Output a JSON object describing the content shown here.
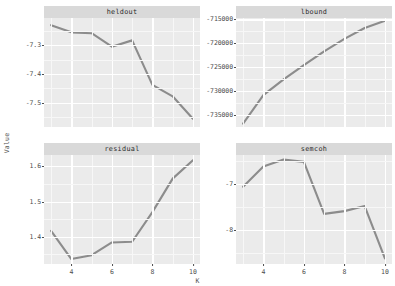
{
  "chart_data": {
    "type": "line",
    "title": "",
    "xlabel": "K",
    "ylabel": "Value",
    "grid": true,
    "legend": "none",
    "facet_layout": "2x2",
    "x": [
      3,
      4,
      5,
      6,
      7,
      8,
      9,
      10
    ],
    "xlim": [
      2.65,
      10.35
    ],
    "xticks": [
      4,
      6,
      8,
      10
    ],
    "xtick_labels": [
      "4",
      "6",
      "8",
      "10"
    ],
    "panels": [
      {
        "name": "heldout",
        "strip_label": "heldout",
        "values": [
          -7.23,
          -7.255,
          -7.258,
          -7.305,
          -7.283,
          -7.438,
          -7.478,
          -7.556
        ],
        "ylim": [
          -7.585,
          -7.205
        ],
        "yticks": [
          -7.3,
          -7.4,
          -7.5
        ],
        "ytick_labels": [
          "-7.3",
          "-7.4",
          "-7.5"
        ]
      },
      {
        "name": "lbound",
        "strip_label": "lbound",
        "values": [
          -736900,
          -730900,
          -727600,
          -724600,
          -721700,
          -719100,
          -716800,
          -715300
        ],
        "ylim": [
          -737600,
          -714700
        ],
        "yticks": [
          -715000,
          -720000,
          -725000,
          -730000,
          -735000
        ],
        "ytick_labels": [
          "-715000",
          "-720000",
          "-725000",
          "-730000",
          "-735000"
        ]
      },
      {
        "name": "residual",
        "strip_label": "residual",
        "values": [
          1.417,
          1.337,
          1.348,
          1.384,
          1.386,
          1.47,
          1.565,
          1.617
        ],
        "ylim": [
          1.323,
          1.632
        ],
        "yticks": [
          1.6,
          1.5,
          1.4
        ],
        "ytick_labels": [
          "1.6",
          "1.5",
          "1.4"
        ]
      },
      {
        "name": "semcoh",
        "strip_label": "semcoh",
        "values": [
          -7.06,
          -6.62,
          -6.47,
          -6.52,
          -7.65,
          -7.59,
          -7.48,
          -8.62
        ],
        "ylim": [
          -8.74,
          -6.37
        ],
        "yticks": [
          -7,
          -8
        ],
        "ytick_labels": [
          "-7",
          "-8"
        ]
      }
    ]
  },
  "colors": {
    "panel_background": "#ebebeb",
    "strip_background": "#d9d9d9",
    "gridline_major": "#ffffff",
    "gridline_minor": "#f7f7f7",
    "line": "#8c8c8c",
    "text": "#4d4d4d",
    "page_background": "#ffffff"
  }
}
